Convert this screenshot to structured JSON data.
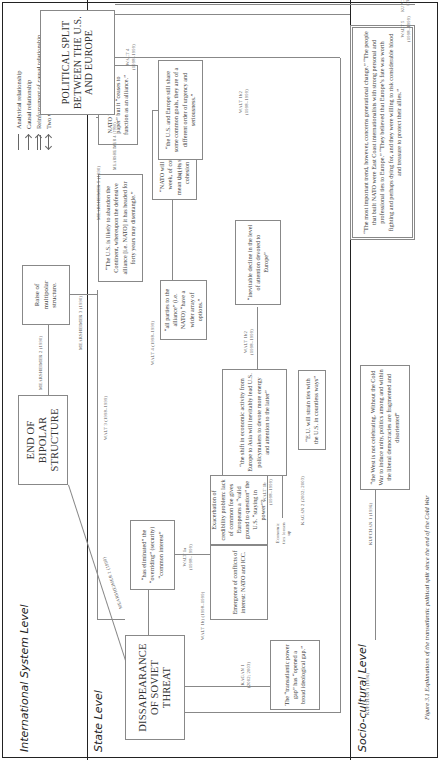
{
  "figure": {
    "caption": "Figure 3.1 Explanations of the transatlantic political split since the end of the Cold War"
  },
  "levels": {
    "international": "International System Level",
    "state": "State Level",
    "socio": "Socio-cultural Level"
  },
  "legend": {
    "items": [
      {
        "symbol": "line",
        "label": "Analytical relationship"
      },
      {
        "symbol": "arrow",
        "label": "Causal relationship"
      },
      {
        "symbol": "double-arrow",
        "label": "Reinforcement of causal relationship"
      },
      {
        "symbol": "two-way-arrow",
        "label": "Two way causal relationship"
      }
    ]
  },
  "nodes": {
    "end_bipolar": "END OF BIPOLAR STRUCTURE",
    "raise_multipolar": "Raise of multipolar structure.",
    "soviet_threat": "DISSAPEARANCE OF SOVIET THREAT",
    "political_split": "POLITICAL SPLIT BETWEEN THE U.S. AND EUROPE",
    "has_eliminated": "“has eliminated” the “overriding” (security) “common interest”",
    "all_parties": "“all parties to the alliance” (i.e. NATO) “have a wider array of options.”",
    "us_abandon": "“The U.S. is likely to abandon the Continent, whereupon the defensive alliance [i.e. NATO] it has headed for forty years may disentangle.”",
    "nato_dissolve": "“NATO will not dissolve next week, of course. But it does mean that its strongest source of cohesion is now gone.”",
    "nato_persist": "NATO “may persist on paper” but it “ceases to function as an alliance.”",
    "us_europe_goals": "“the U.S. and Europe still share some common goals, they are of a different order of urgency and seriousness.”",
    "exacerbation": "Exacerbation of credibility problem: lack of common foe gives Europeans a “valid ground to question” the U.S. “staying in power”?",
    "emergence": "Emergence of conflicts of interest: NATO and ICC.",
    "shift_economic": "“the shift in economic activity from Europe to Asia will inevitably lead U.S. policymakers to devote more energy and attention to the latter”",
    "eu_strain": "“E.U. will strain ties with the U.S. in countless ways”",
    "inevitable_decline": "“inevitable decline in the level of attention devoted to Europe”",
    "transatlantic_gap": "The “transatlantic power gap” has “opened a broad ideological gap.”",
    "west_not_celebrating": "“the West is not celebrating. Without the Cold War to induce unity, politics among and within the liberal democracies are fragmented and disoriented”",
    "most_important_trend": "“The most important trend, however, concerns generational change.” “The people that built NATO were East Coast internationalists with strong personal and professional ties to Europe.” “They believed that Europe’s fate was worth fighting and perhaps dying for, and they were willing to risk considerable blood and treasure to protect their allies.”"
  },
  "edge_labels": {
    "mearsheimer1": "MEARSHEIMER 1 (1990)",
    "mearsheimer2": "MEARSHEIMER 2 (1990)",
    "mearsheimer3": "MEARSHEIMER 3 (1990)",
    "mearsheimer4": "MEARSHEIMER 4 (1990)",
    "mearsheimer5": "MEARSHEIMER 5 (1990)",
    "walt1a": "WALT 1a",
    "walt1a_years": "(1998–1999)",
    "walt1b": "WALT 1b",
    "walt1b_years": "(1998–1999)",
    "walt1b_bottom": "WALT 1b) (1998–1999)",
    "walt1b2_a": "WALT 1b2",
    "walt1b2_a_years": "(1998–1999)",
    "walt1b2_b": "WALT 1b2",
    "walt1b2_b_years": "(1998–1999)",
    "walt3": "WALT 3 (1998–1999)",
    "walt3b": "WALT 3",
    "walt3b_years": "(1998–1999)",
    "walt4": "WALT 4 (1998–1999)",
    "walt4b": "WALT 4",
    "walt4b_years": "(1998–1999)",
    "walt5": "WALT 5",
    "walt5_years": "(1998–1999)",
    "kagan1": "KAGAN 1",
    "kagan1_years": "(2002; 2003)",
    "kagan2": "KAGAN 2 (2002; 2003)",
    "kupchan1": "KUPCHAN 1 (1996)",
    "kupchan1_bottom": "KUPCHAN 1 (1996)",
    "kupchan2": "KUPCHAN 2",
    "kupchan2_years": "(1996)",
    "economic_ties": "Economic ties loosen up"
  },
  "colors": {
    "line": "#888888",
    "divider": "#222222",
    "text": "#333333"
  }
}
